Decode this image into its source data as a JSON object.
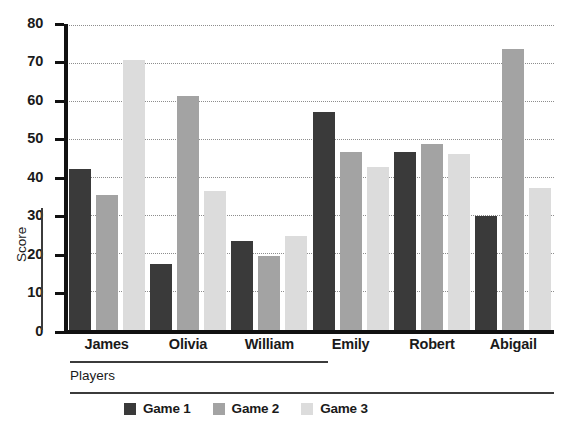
{
  "chart_data": {
    "type": "bar",
    "title": "",
    "subtitle": "",
    "xlabel": "Players",
    "ylabel": "Score",
    "categories": [
      "James",
      "Olivia",
      "William",
      "Emily",
      "Robert",
      "Abigail"
    ],
    "series": [
      {
        "name": "Game 1",
        "color": "#3a3a3a",
        "values": [
          42.5,
          17.5,
          23.5,
          57.5,
          46.8,
          30.0
        ]
      },
      {
        "name": "Game 2",
        "color": "#a3a3a3",
        "values": [
          35.5,
          61.5,
          19.5,
          46.8,
          49.0,
          74.0
        ]
      },
      {
        "name": "Game 3",
        "color": "#dcdcdc",
        "values": [
          71.0,
          36.5,
          24.8,
          43.0,
          46.3,
          37.5
        ]
      }
    ],
    "ylim": [
      0,
      80
    ],
    "yticks": [
      0,
      10,
      20,
      30,
      40,
      50,
      60,
      70,
      80
    ],
    "ytick_labels": [
      "0",
      "10",
      "20",
      "30",
      "40",
      "50",
      "60",
      "70",
      "80"
    ],
    "grid": "horizontal-dotted",
    "legend_position": "bottom",
    "legend_entries": [
      "Game 1",
      "Game 2",
      "Game 3"
    ],
    "axis_color": "#111111",
    "grid_color": "#8d8d8d",
    "background": "#ffffff"
  }
}
